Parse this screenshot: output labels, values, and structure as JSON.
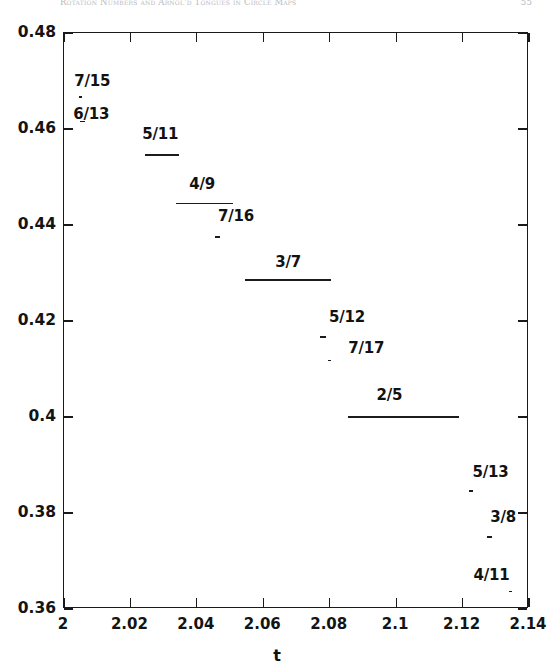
{
  "runhead": {
    "title": "Rotation Numbers and Arnol'd Tongues in Circle Maps",
    "page": "55"
  },
  "chart_data": {
    "type": "line",
    "title": "",
    "xlabel": "t",
    "ylabel": "Rotation number",
    "xlim": [
      2,
      2.14
    ],
    "ylim": [
      0.36,
      0.48
    ],
    "xticks": [
      "2",
      "2.02",
      "2.04",
      "2.06",
      "2.08",
      "2.1",
      "2.12",
      "2.14"
    ],
    "xtick_values": [
      2,
      2.02,
      2.04,
      2.06,
      2.08,
      2.1,
      2.12,
      2.14
    ],
    "yticks": [
      "0.48",
      "0.46",
      "0.44",
      "0.42",
      "0.4",
      "0.38",
      "0.36"
    ],
    "ytick_values": [
      0.48,
      0.46,
      0.44,
      0.42,
      0.4,
      0.38,
      0.36
    ],
    "grid": false,
    "legend": null,
    "steps": [
      {
        "label": "7/15",
        "value": 0.46667,
        "x_start": 2.0045,
        "x_end": 2.0055,
        "label_x": 2.0088,
        "label_y": 0.46975
      },
      {
        "label": "6/13",
        "value": 0.46154,
        "x_start": 2.0049,
        "x_end": 2.0062,
        "label_x": 2.0085,
        "label_y": 0.46285
      },
      {
        "label": "5/11",
        "value": 0.45455,
        "x_start": 2.0245,
        "x_end": 2.0345,
        "label_x": 2.0293,
        "label_y": 0.4587
      },
      {
        "label": "4/9",
        "value": 0.44444,
        "x_start": 2.0338,
        "x_end": 2.051,
        "label_x": 2.0419,
        "label_y": 0.4484
      },
      {
        "label": "7/16",
        "value": 0.4375,
        "x_start": 2.0455,
        "x_end": 2.047,
        "label_x": 2.0521,
        "label_y": 0.4416
      },
      {
        "label": "3/7",
        "value": 0.42857,
        "x_start": 2.0545,
        "x_end": 2.0805,
        "label_x": 2.0678,
        "label_y": 0.432
      },
      {
        "label": "5/12",
        "value": 0.41667,
        "x_start": 2.077,
        "x_end": 2.079,
        "label_x": 2.0855,
        "label_y": 0.42055
      },
      {
        "label": "7/17",
        "value": 0.41176,
        "x_start": 2.0795,
        "x_end": 2.0805,
        "label_x": 2.0913,
        "label_y": 0.41415
      },
      {
        "label": "2/5",
        "value": 0.4,
        "x_start": 2.0855,
        "x_end": 2.119,
        "label_x": 2.0983,
        "label_y": 0.4044
      },
      {
        "label": "5/13",
        "value": 0.38462,
        "x_start": 2.1218,
        "x_end": 2.1232,
        "label_x": 2.1287,
        "label_y": 0.3884
      },
      {
        "label": "3/8",
        "value": 0.375,
        "x_start": 2.1275,
        "x_end": 2.129,
        "label_x": 2.1325,
        "label_y": 0.37895
      },
      {
        "label": "4/11",
        "value": 0.36364,
        "x_start": 2.134,
        "x_end": 2.135,
        "label_x": 2.129,
        "label_y": 0.3669
      }
    ]
  }
}
